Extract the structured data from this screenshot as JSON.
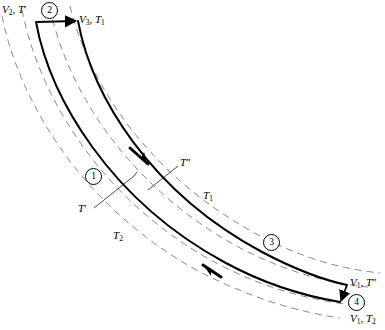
{
  "figure": {
    "type": "thermodynamic-cycle-diagram"
  },
  "colors": {
    "line": "#000000",
    "dashed": "#8a8a8a",
    "background": "#ffffff"
  },
  "labels": {
    "v2_tprime": {
      "v": "V",
      "vsub": "2",
      "t": "T",
      "prime": "′"
    },
    "v3_t1": {
      "v": "V",
      "vsub": "3",
      "t": "T",
      "tsub": "1"
    },
    "v1_tdprime": {
      "v": "V",
      "vsub": "1",
      "t": "T",
      "prime": "″"
    },
    "v1_t2": {
      "v": "V",
      "vsub": "1",
      "t": "T",
      "tsub": "2"
    },
    "t_prime": {
      "t": "T",
      "prime": "′"
    },
    "t_double_prime": {
      "t": "T",
      "prime": "″"
    },
    "t_one": {
      "t": "T",
      "tsub": "1"
    },
    "t_two": {
      "t": "T",
      "tsub": "2"
    }
  },
  "state_points": [
    {
      "id": "1",
      "number": "1"
    },
    {
      "id": "2",
      "number": "2"
    },
    {
      "id": "3",
      "number": "3"
    },
    {
      "id": "4",
      "number": "4"
    }
  ],
  "curves": {
    "isotherm_names": [
      "T′",
      "T″",
      "T₁",
      "T₂"
    ],
    "process_count": 2,
    "arrow_count": 4
  }
}
